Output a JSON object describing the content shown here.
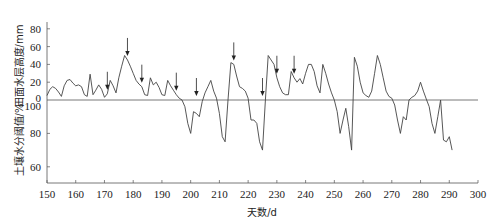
{
  "chart_data": {
    "type": "line",
    "title": "",
    "xlabel": "天数/d",
    "x_ticks": [
      150,
      160,
      170,
      180,
      190,
      200,
      210,
      220,
      230,
      240,
      250,
      260,
      270,
      280,
      290,
      300
    ],
    "xlim": [
      150,
      300
    ],
    "panels": [
      {
        "name": "water-depth",
        "ylabel": "田面水层高度/mm",
        "ylim": [
          0,
          90
        ],
        "y_ticks": [
          0,
          20,
          40,
          60,
          80
        ],
        "series": [
          {
            "name": "田面水层高度",
            "points": [
              [
                150,
                5
              ],
              [
                151,
                12
              ],
              [
                152,
                15
              ],
              [
                153,
                14
              ],
              [
                154,
                9
              ],
              [
                155,
                5
              ],
              [
                156,
                16
              ],
              [
                157,
                22
              ],
              [
                158,
                23
              ],
              [
                159,
                20
              ],
              [
                160,
                17
              ],
              [
                161,
                18
              ],
              [
                162,
                15
              ],
              [
                163,
                6
              ],
              [
                164,
                4
              ],
              [
                165,
                29
              ],
              [
                166,
                6
              ],
              [
                167,
                10
              ],
              [
                168,
                16
              ],
              [
                169,
                17
              ],
              [
                170,
                10
              ],
              [
                171,
                3
              ],
              [
                172,
                6
              ],
              [
                173,
                22
              ],
              [
                174,
                16
              ],
              [
                175,
                8
              ],
              [
                176,
                20
              ],
              [
                178,
                38
              ],
              [
                179,
                50
              ],
              [
                180,
                45
              ],
              [
                181,
                37
              ],
              [
                182,
                28
              ],
              [
                183,
                22
              ],
              [
                184,
                18
              ],
              [
                185,
                15
              ],
              [
                186,
                5
              ],
              [
                187,
                5
              ],
              [
                188,
                25
              ],
              [
                189,
                17
              ],
              [
                190,
                17
              ],
              [
                191,
                15
              ],
              [
                192,
                5
              ],
              [
                193,
                5
              ],
              [
                194,
                22
              ],
              [
                195,
                15
              ],
              [
                196,
                10
              ],
              [
                197,
                5
              ],
              [
                198,
                0
              ]
            ]
          }
        ]
      },
      {
        "name": "soil-moisture",
        "ylabel": "土壤水分阈值/%",
        "ylim": [
          50,
          100
        ],
        "y_ticks": [
          60,
          80,
          100
        ],
        "series": [
          {
            "name": "土壤水分阈值",
            "points": [
              [
                150,
                100
              ]
            ]
          }
        ]
      }
    ],
    "combined_trace": [
      [
        150,
        "w",
        5
      ],
      [
        151,
        "w",
        12
      ],
      [
        152,
        "w",
        15
      ],
      [
        153,
        "w",
        13
      ],
      [
        154,
        "w",
        9
      ],
      [
        155,
        "w",
        4
      ],
      [
        156,
        "w",
        16
      ],
      [
        157,
        "w",
        22
      ],
      [
        158,
        "w",
        23
      ],
      [
        159,
        "w",
        19
      ],
      [
        160,
        "w",
        16
      ],
      [
        161,
        "w",
        17
      ],
      [
        162,
        "w",
        15
      ],
      [
        163,
        "w",
        6
      ],
      [
        164,
        "w",
        4
      ],
      [
        165,
        "w",
        29
      ],
      [
        166,
        "w",
        6
      ],
      [
        167,
        "w",
        11
      ],
      [
        168,
        "w",
        17
      ],
      [
        169,
        "w",
        12
      ],
      [
        170,
        "w",
        3
      ],
      [
        171,
        "w",
        7
      ],
      [
        172,
        "w",
        22
      ],
      [
        173,
        "w",
        16
      ],
      [
        174,
        "w",
        8
      ],
      [
        175,
        "w",
        25
      ],
      [
        176,
        "w",
        38
      ],
      [
        177,
        "w",
        50
      ],
      [
        178,
        "w",
        45
      ],
      [
        179,
        "w",
        38
      ],
      [
        180,
        "w",
        30
      ],
      [
        181,
        "w",
        22
      ],
      [
        182,
        "w",
        18
      ],
      [
        183,
        "w",
        15
      ],
      [
        184,
        "w",
        6
      ],
      [
        185,
        "w",
        5
      ],
      [
        186,
        "w",
        25
      ],
      [
        187,
        "w",
        17
      ],
      [
        188,
        "w",
        20
      ],
      [
        189,
        "w",
        14
      ],
      [
        190,
        "w",
        6
      ],
      [
        191,
        "w",
        5
      ],
      [
        192,
        "w",
        22
      ],
      [
        193,
        "w",
        16
      ],
      [
        194,
        "w",
        11
      ],
      [
        195,
        "w",
        6
      ],
      [
        196,
        "w",
        2
      ],
      [
        197,
        "w",
        0
      ],
      [
        198,
        "s",
        96
      ],
      [
        199,
        "s",
        86
      ],
      [
        200,
        "s",
        80
      ],
      [
        201,
        "s",
        93
      ],
      [
        202,
        "s",
        92
      ],
      [
        203,
        "s",
        90
      ],
      [
        204,
        "s",
        99
      ],
      [
        205,
        "w",
        8
      ],
      [
        206,
        "w",
        15
      ],
      [
        207,
        "w",
        22
      ],
      [
        208,
        "w",
        10
      ],
      [
        209,
        "w",
        2
      ],
      [
        210,
        "s",
        92
      ],
      [
        211,
        "s",
        78
      ],
      [
        212,
        "s",
        75
      ],
      [
        213,
        "s",
        100
      ],
      [
        214,
        "w",
        42
      ],
      [
        215,
        "w",
        40
      ],
      [
        216,
        "w",
        27
      ],
      [
        217,
        "w",
        15
      ],
      [
        218,
        "w",
        13
      ],
      [
        219,
        "w",
        10
      ],
      [
        220,
        "w",
        2
      ],
      [
        221,
        "s",
        88
      ],
      [
        222,
        "s",
        88
      ],
      [
        223,
        "s",
        86
      ],
      [
        224,
        "s",
        75
      ],
      [
        225,
        "s",
        70
      ],
      [
        226,
        "s",
        100
      ],
      [
        227,
        "w",
        50
      ],
      [
        228,
        "w",
        45
      ],
      [
        229,
        "w",
        40
      ],
      [
        230,
        "w",
        25
      ],
      [
        231,
        "w",
        15
      ],
      [
        232,
        "w",
        8
      ],
      [
        233,
        "w",
        6
      ],
      [
        234,
        "w",
        6
      ],
      [
        235,
        "w",
        32
      ],
      [
        236,
        "w",
        25
      ],
      [
        237,
        "w",
        20
      ],
      [
        238,
        "w",
        24
      ],
      [
        239,
        "w",
        18
      ],
      [
        240,
        "w",
        30
      ],
      [
        241,
        "w",
        40
      ],
      [
        242,
        "w",
        40
      ],
      [
        243,
        "w",
        32
      ],
      [
        244,
        "w",
        16
      ],
      [
        245,
        "w",
        8
      ],
      [
        246,
        "w",
        40
      ],
      [
        247,
        "w",
        30
      ],
      [
        248,
        "w",
        18
      ],
      [
        249,
        "w",
        8
      ],
      [
        250,
        "w",
        0
      ],
      [
        251,
        "s",
        93
      ],
      [
        252,
        "s",
        80
      ],
      [
        253,
        "s",
        88
      ],
      [
        254,
        "s",
        95
      ],
      [
        255,
        "s",
        84
      ],
      [
        256,
        "s",
        70
      ],
      [
        257,
        "w",
        48
      ],
      [
        258,
        "w",
        38
      ],
      [
        259,
        "w",
        20
      ],
      [
        260,
        "w",
        8
      ],
      [
        261,
        "w",
        5
      ],
      [
        262,
        "w",
        3
      ],
      [
        263,
        "w",
        10
      ],
      [
        264,
        "w",
        30
      ],
      [
        265,
        "w",
        50
      ],
      [
        266,
        "w",
        40
      ],
      [
        267,
        "w",
        25
      ],
      [
        268,
        "w",
        10
      ],
      [
        269,
        "w",
        4
      ],
      [
        270,
        "w",
        2
      ],
      [
        271,
        "s",
        97
      ],
      [
        272,
        "s",
        88
      ],
      [
        273,
        "s",
        80
      ],
      [
        274,
        "s",
        90
      ],
      [
        275,
        "s",
        88
      ],
      [
        276,
        "s",
        100
      ],
      [
        277,
        "w",
        3
      ],
      [
        278,
        "w",
        5
      ],
      [
        279,
        "w",
        10
      ],
      [
        280,
        "w",
        20
      ],
      [
        281,
        "w",
        10
      ],
      [
        282,
        "w",
        1
      ],
      [
        283,
        "s",
        96
      ],
      [
        284,
        "s",
        86
      ],
      [
        285,
        "s",
        80
      ],
      [
        286,
        "s",
        90
      ],
      [
        287,
        "s",
        100
      ],
      [
        288,
        "s",
        76
      ],
      [
        289,
        "s",
        75
      ],
      [
        290,
        "s",
        78
      ],
      [
        291,
        "s",
        70
      ]
    ],
    "arrows_at_days": [
      171,
      178,
      183,
      195,
      202,
      215,
      225,
      230,
      236
    ],
    "grid": false,
    "legend": null
  },
  "axes": {
    "x_title": "天数/d",
    "y_top_title": "田面水层高度/mm",
    "y_bottom_title": "土壤水分阈值/%"
  }
}
